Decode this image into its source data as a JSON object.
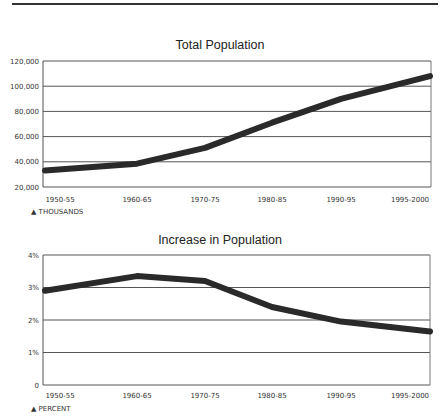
{
  "chart_data": [
    {
      "type": "line",
      "title": "Total Population",
      "xlabel": "",
      "ylabel": "THOUSANDS",
      "unit_label": "▲ THOUSANDS",
      "categories": [
        "1950-55",
        "1960-65",
        "1970-75",
        "1980-85",
        "1990-95",
        "1995-2000"
      ],
      "series": [
        {
          "name": "Total Population",
          "values": [
            33000,
            38500,
            51000,
            71000,
            90000,
            108000
          ]
        }
      ],
      "y_ticks": [
        "120,000",
        "100,000",
        "80,000",
        "60,000",
        "40,000",
        "20,000"
      ],
      "ylim": [
        20000,
        120000
      ],
      "grid": true,
      "legend": "none"
    },
    {
      "type": "line",
      "title": "Increase in Population",
      "xlabel": "",
      "ylabel": "PERCENT",
      "unit_label": "▲ PERCENT",
      "categories": [
        "1950-55",
        "1960-65",
        "1970-75",
        "1980-85",
        "1990-95",
        "1995-2000"
      ],
      "series": [
        {
          "name": "Increase in Population",
          "values": [
            2.9,
            3.35,
            3.2,
            2.4,
            1.95,
            1.65
          ]
        }
      ],
      "y_ticks": [
        "4%",
        "3%",
        "2%",
        "1%",
        "0"
      ],
      "ylim": [
        0,
        4
      ],
      "grid": true,
      "legend": "none"
    }
  ]
}
